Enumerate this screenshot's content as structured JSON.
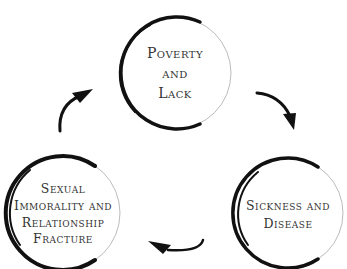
{
  "diagram": {
    "type": "cycle",
    "nodes": [
      {
        "id": "poverty",
        "lines": [
          "Poverty",
          "and",
          "Lack"
        ]
      },
      {
        "id": "sickness",
        "lines": [
          "Sickness and",
          "Disease"
        ]
      },
      {
        "id": "immorality",
        "lines": [
          "Sexual",
          "Immorality and",
          "Relationship",
          "Fracture"
        ]
      }
    ],
    "edges": [
      {
        "from": "poverty",
        "to": "sickness"
      },
      {
        "from": "sickness",
        "to": "immorality"
      },
      {
        "from": "immorality",
        "to": "poverty"
      }
    ],
    "colors": {
      "stroke": "#111111",
      "fill": "#ffffff",
      "text": "#333333"
    }
  }
}
